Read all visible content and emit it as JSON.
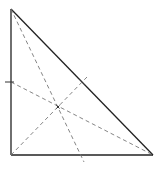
{
  "diagram": {
    "type": "triangle-medians",
    "colors": {
      "background": "#ffffff",
      "side": "#222222",
      "median": "#777777",
      "tick": "#333333"
    },
    "vertices": {
      "top": [
        11,
        9
      ],
      "bottom_left": [
        11,
        155
      ],
      "bottom_right": [
        153,
        155
      ]
    },
    "midpoints": {
      "left_side": [
        11,
        82
      ],
      "bottom_side": [
        82,
        155
      ],
      "hypotenuse": [
        82,
        82
      ]
    },
    "centroid": [
      58,
      107
    ],
    "medians": [
      {
        "from": [
          11,
          9
        ],
        "to": [
          84,
          162
        ],
        "label": "median-from-top"
      },
      {
        "from": [
          11,
          82
        ],
        "to": [
          153,
          155
        ],
        "label": "median-from-bottom-right"
      },
      {
        "from": [
          11,
          155
        ],
        "to": [
          87,
          77
        ],
        "label": "median-from-bottom-left"
      }
    ],
    "ticks": [
      {
        "from": [
          5,
          82
        ],
        "to": [
          14,
          82
        ],
        "label": "left-side-midpoint-tick"
      },
      {
        "from": [
          79,
          79
        ],
        "to": [
          85,
          85
        ],
        "label": "hypotenuse-midpoint-tick"
      }
    ]
  }
}
